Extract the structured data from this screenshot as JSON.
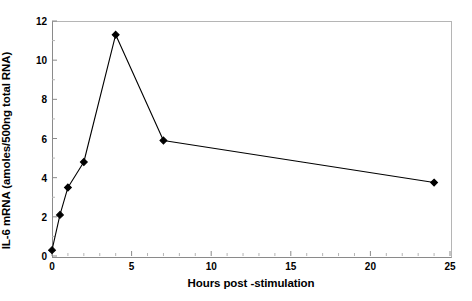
{
  "chart_data": {
    "type": "line",
    "title": "",
    "xlabel": "Hours post -stimulation",
    "ylabel": "IL-6 mRNA (amoles/500ng total RNA)",
    "xlim": [
      0,
      25
    ],
    "ylim": [
      0,
      12
    ],
    "xticks": [
      0,
      5,
      10,
      15,
      20,
      25
    ],
    "yticks": [
      0,
      2,
      4,
      6,
      8,
      10,
      12
    ],
    "xtick_labels": [
      "0",
      "5",
      "10",
      "15",
      "20",
      "25"
    ],
    "ytick_labels": [
      "0",
      "2",
      "4",
      "6",
      "8",
      "10",
      "12"
    ],
    "grid": false,
    "legend": null,
    "series": [
      {
        "name": "IL-6 mRNA",
        "marker": "diamond",
        "marker_color": "#000000",
        "line_color": "#000000",
        "x": [
          0,
          0.5,
          1,
          2,
          4,
          7,
          24
        ],
        "y": [
          0.3,
          2.1,
          3.5,
          4.8,
          11.3,
          5.9,
          3.75
        ]
      }
    ]
  },
  "figure": {
    "background_color": "#ffffff",
    "axis_color": "#8a8a8a",
    "frame_color": "#b5b5b5"
  }
}
